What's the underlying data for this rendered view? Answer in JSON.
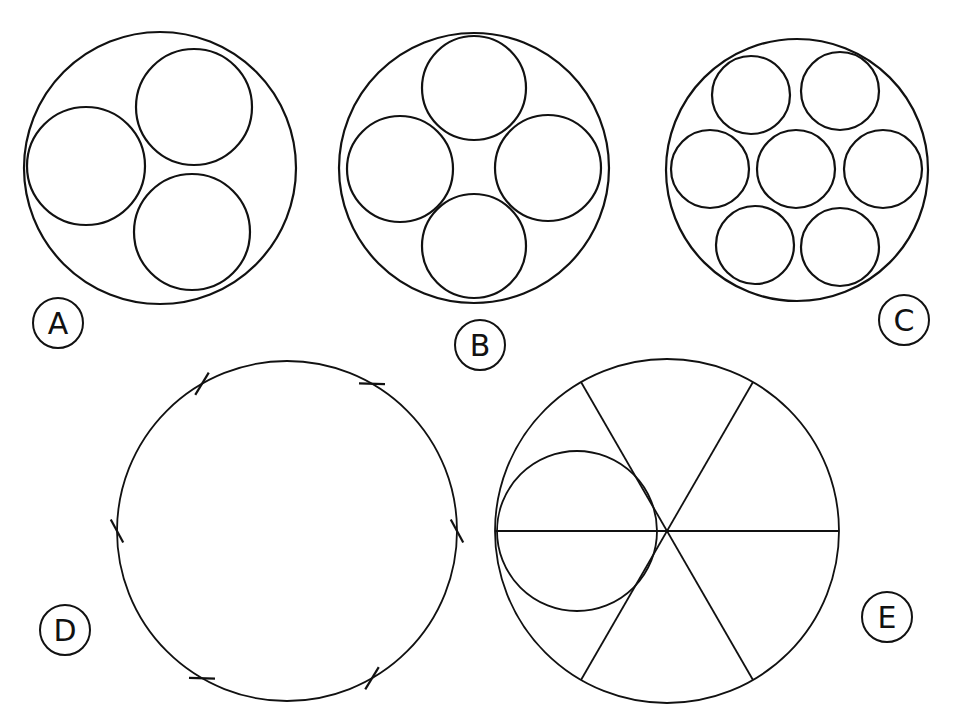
{
  "figure": {
    "colors": {
      "ink": "#111111",
      "paper": "#ffffff"
    },
    "panels": [
      {
        "id": "A",
        "label": "A",
        "content": "three equal circles inscribed in a larger circle",
        "inner_circle_count": 3
      },
      {
        "id": "B",
        "label": "B",
        "content": "four equal circles inscribed in a larger circle",
        "inner_circle_count": 4
      },
      {
        "id": "C",
        "label": "C",
        "content": "seven equal circles (hexagonal packing) inscribed in a larger circle",
        "inner_circle_count": 7
      },
      {
        "id": "D",
        "label": "D",
        "content": "circle divided into six equal parts by tick marks",
        "tick_count": 6
      },
      {
        "id": "E",
        "label": "E",
        "content": "circle divided into six sectors by three diameters, with a circle inscribed in a 60-degree sector",
        "diameter_count": 3,
        "sector_angle_deg": 60
      }
    ]
  }
}
